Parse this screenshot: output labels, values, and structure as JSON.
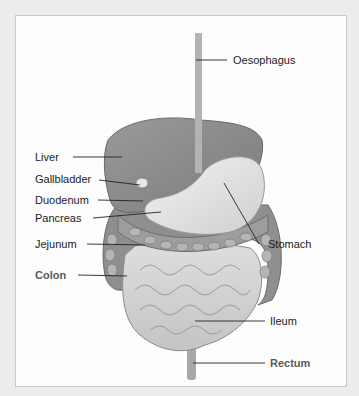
{
  "diagram": {
    "type": "anatomical-illustration",
    "labels": [
      {
        "id": "oesophagus",
        "text": "Oesophagus",
        "bold": false
      },
      {
        "id": "liver",
        "text": "Liver",
        "bold": false
      },
      {
        "id": "gallbladder",
        "text": "Gallbladder",
        "bold": false
      },
      {
        "id": "duodenum",
        "text": "Duodenum",
        "bold": false
      },
      {
        "id": "pancreas",
        "text": "Pancreas",
        "bold": false
      },
      {
        "id": "jejunum",
        "text": "Jejunum",
        "bold": false
      },
      {
        "id": "colon",
        "text": "Colon",
        "bold": true
      },
      {
        "id": "stomach",
        "text": "Stomach",
        "bold": false
      },
      {
        "id": "ileum",
        "text": "Ileum",
        "bold": false
      },
      {
        "id": "rectum",
        "text": "Rectum",
        "bold": true
      }
    ]
  }
}
